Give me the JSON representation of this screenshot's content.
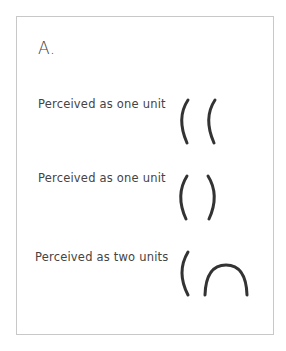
{
  "figure": {
    "panel_label": "A.",
    "rows": [
      {
        "label": "Perceived as one unit",
        "shapes": [
          "left-paren-arc",
          "left-paren-arc"
        ]
      },
      {
        "label": "Perceived as one unit",
        "shapes": [
          "left-paren-arc",
          "right-paren-arc"
        ]
      },
      {
        "label": "Perceived as two units",
        "shapes": [
          "left-paren-arc",
          "upward-arch"
        ]
      }
    ],
    "colors": {
      "stroke": "#333333",
      "text": "#444444",
      "border": "#c8c8c8",
      "background": "#ffffff"
    }
  }
}
